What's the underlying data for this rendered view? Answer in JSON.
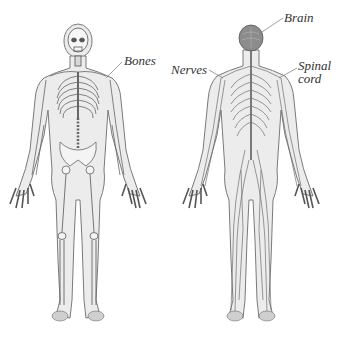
{
  "diagram": {
    "figures": [
      {
        "id": "skeleton",
        "description": "Human figure showing the skeletal system",
        "labels": [
          {
            "text": "Bones",
            "x": 124,
            "y": 55
          }
        ]
      },
      {
        "id": "nervous",
        "description": "Human figure showing the nervous system",
        "labels": [
          {
            "text": "Brain",
            "x": 284,
            "y": 12
          },
          {
            "text": "Nerves",
            "x": 171,
            "y": 64
          },
          {
            "text": "Spinal",
            "x": 298,
            "y": 60
          },
          {
            "text": "cord",
            "x": 298,
            "y": 73
          }
        ]
      }
    ]
  },
  "colors": {
    "background": "#ffffff",
    "outline": "#6b6b6b",
    "fill": "#e4e4e4",
    "bone": "#f4f4f4",
    "nerve": "#7a7a7a",
    "brain": "#8c8c8c",
    "label": "#333333"
  }
}
